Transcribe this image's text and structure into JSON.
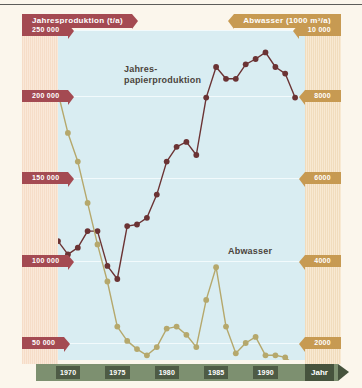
{
  "header": {
    "left_title": "Jahresproduktion (t/a)",
    "right_title": "Abwasser (1000 m³/a)"
  },
  "axes": {
    "y_left": {
      "unit": "t/a",
      "ticks": [
        "250 000",
        "200 000",
        "150 000",
        "100 000",
        "50 000"
      ],
      "values": [
        250000,
        200000,
        150000,
        100000,
        50000
      ]
    },
    "y_right": {
      "unit": "1000 m³/a",
      "ticks": [
        "10 000",
        "8000",
        "6000",
        "4000",
        "2000"
      ],
      "values": [
        10000,
        8000,
        6000,
        4000,
        2000
      ]
    },
    "x": {
      "label": "Jahr",
      "ticks": [
        "1970",
        "1975",
        "1980",
        "1985",
        "1990"
      ],
      "values": [
        1970,
        1975,
        1980,
        1985,
        1990
      ]
    }
  },
  "series_labels": {
    "production_line1": "Jahres-",
    "production_line2": "papierproduktion",
    "wastewater": "Abwasser"
  },
  "colors": {
    "production": "#6b3334",
    "wastewater": "#b5a86c",
    "plot_background": "#d9edf2",
    "page_background": "#fbf6ec",
    "axis_band_left": "#f6ddc8",
    "axis_band_right": "#f1dcbd",
    "x_axis_band": "#7d9070",
    "x_tick_chip": "#4e5b45",
    "banner_red": "#a44a52",
    "banner_tan": "#c79a52"
  },
  "chart_data": {
    "type": "line",
    "xlabel": "Jahr",
    "grid": true,
    "legend": "inline-annotation",
    "xlim": [
      1969,
      1994
    ],
    "x": [
      1969,
      1970,
      1971,
      1972,
      1973,
      1974,
      1975,
      1976,
      1977,
      1978,
      1979,
      1980,
      1981,
      1982,
      1983,
      1984,
      1985,
      1986,
      1987,
      1988,
      1989,
      1990,
      1991,
      1992,
      1993
    ],
    "series": [
      {
        "name": "Jahres-papierproduktion",
        "axis": "left",
        "ylabel": "Jahresproduktion (t/a)",
        "ylim": [
          50000,
          250000
        ],
        "unit": "t/a",
        "color": "#6b3334",
        "values": [
          112000,
          104000,
          108000,
          118000,
          118000,
          97000,
          89000,
          121000,
          122000,
          126000,
          140000,
          160000,
          169000,
          172000,
          164000,
          199000,
          222000,
          213000,
          213000,
          224000,
          228000,
          233000,
          222000,
          217000,
          199000
        ]
      },
      {
        "name": "Abwasser",
        "axis": "right",
        "ylabel": "Abwasser (1000 m³/a)",
        "ylim": [
          1200,
          10000
        ],
        "unit": "1000 m³/a",
        "color": "#b5a86c",
        "values": [
          8100,
          7100,
          6400,
          5400,
          4400,
          3500,
          2400,
          2050,
          1850,
          1700,
          1900,
          2350,
          2400,
          2200,
          1900,
          3050,
          3850,
          2400,
          1750,
          2000,
          2150,
          1700,
          1700,
          1650,
          1450
        ]
      }
    ]
  }
}
